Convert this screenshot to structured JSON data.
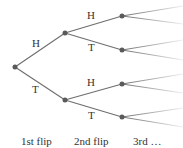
{
  "diagram": {
    "type": "probability-tree",
    "edge_color": "#6e6e6e",
    "node_color": "#5a5a5a",
    "branches": {
      "level1_upper": "H",
      "level1_lower": "T",
      "level2_upper_upper": "H",
      "level2_upper_lower": "T",
      "level2_lower_upper": "H",
      "level2_lower_lower": "T"
    },
    "columns": [
      "1st flip",
      "2nd flip",
      "3rd …"
    ]
  }
}
